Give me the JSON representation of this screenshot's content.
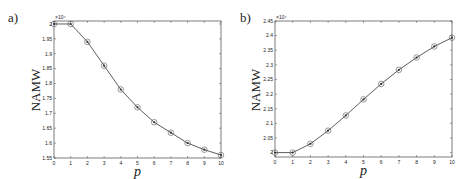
{
  "chart_data": [
    {
      "type": "line",
      "panel_label": "a)",
      "title": "",
      "xlabel": "p",
      "ylabel": "NAMW",
      "y_multiplier": "×10⁴",
      "x": [
        0,
        1,
        2,
        3,
        4,
        5,
        6,
        7,
        8,
        9,
        10
      ],
      "series": [
        {
          "name": "NAMW",
          "marker": "circle+dot",
          "values": [
            2.0,
            2.0,
            1.94,
            1.86,
            1.78,
            1.72,
            1.67,
            1.635,
            1.6,
            1.578,
            1.56
          ]
        }
      ],
      "xlim": [
        0,
        10
      ],
      "ylim": [
        1.55,
        2.01
      ],
      "xticks": [
        0,
        1,
        2,
        3,
        4,
        5,
        6,
        7,
        8,
        9,
        10
      ],
      "yticks": [
        1.55,
        1.6,
        1.65,
        1.7,
        1.75,
        1.8,
        1.85,
        1.9,
        1.95,
        2.0
      ],
      "ytick_labels": [
        "1.55",
        "1.6",
        "1.65",
        "1.7",
        "1.75",
        "1.8",
        "1.85",
        "1.9",
        "1.95",
        "2"
      ],
      "grid": false,
      "legend": null
    },
    {
      "type": "line",
      "panel_label": "b)",
      "title": "",
      "xlabel": "p",
      "ylabel": "NAMW",
      "y_multiplier": "×10⁴",
      "x": [
        0,
        1,
        2,
        3,
        4,
        5,
        6,
        7,
        8,
        9,
        10
      ],
      "series": [
        {
          "name": "NAMW",
          "marker": "circle+dot",
          "values": [
            2.0,
            2.0,
            2.03,
            2.075,
            2.127,
            2.182,
            2.235,
            2.283,
            2.325,
            2.363,
            2.393
          ]
        }
      ],
      "xlim": [
        0,
        10
      ],
      "ylim": [
        1.985,
        2.45
      ],
      "xticks": [
        0,
        1,
        2,
        3,
        4,
        5,
        6,
        7,
        8,
        9,
        10
      ],
      "yticks": [
        2.0,
        2.05,
        2.1,
        2.15,
        2.2,
        2.25,
        2.3,
        2.35,
        2.4,
        2.45
      ],
      "ytick_labels": [
        "2",
        "2.05",
        "2.1",
        "2.15",
        "2.2",
        "2.25",
        "2.3",
        "2.35",
        "2.4",
        "2.45"
      ],
      "grid": false,
      "legend": null
    }
  ],
  "layout": {
    "panels": [
      {
        "left": 54,
        "right": 221,
        "top": 21,
        "bottom": 158,
        "panel_label_x": 8,
        "panel_label_y": 22,
        "ylabel_x": 40,
        "ylabel_y": 90
      },
      {
        "left": 275,
        "right": 452,
        "top": 21,
        "bottom": 157,
        "panel_label_x": 240,
        "panel_label_y": 22,
        "ylabel_x": 260,
        "ylabel_y": 90
      }
    ],
    "colors": {
      "line": "#333333",
      "axis": "#444444",
      "marker": "#555555"
    }
  }
}
